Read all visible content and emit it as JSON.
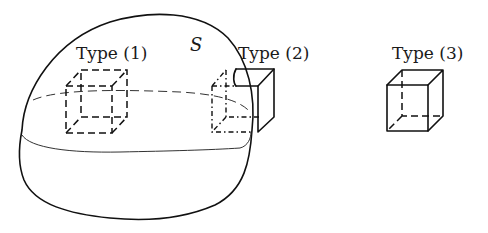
{
  "figure": {
    "surface_label": "S",
    "types": [
      {
        "id": 1,
        "label": "Type (1)",
        "description": "cube entirely inside surface S (all edges dashed)"
      },
      {
        "id": 2,
        "label": "Type (2)",
        "description": "cube intersecting the boundary of surface S (partly dashed, partly solid)"
      },
      {
        "id": 3,
        "label": "Type (3)",
        "description": "cube entirely outside surface S (solid edges, hidden edges dashed)"
      }
    ]
  },
  "colors": {
    "background": "#ffffff",
    "stroke": "#111111"
  }
}
